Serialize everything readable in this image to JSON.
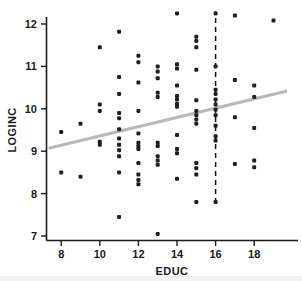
{
  "chart_data": {
    "type": "scatter",
    "title": "",
    "xlabel": "EDUC",
    "ylabel": "LOGINC",
    "xlim": [
      7.2,
      19.8
    ],
    "ylim": [
      6.75,
      12.45
    ],
    "xticks": [
      8,
      10,
      12,
      14,
      16,
      18
    ],
    "yticks": [
      7,
      8,
      9,
      10,
      11,
      12
    ],
    "xtick_labels": [
      "8",
      "10",
      "12",
      "14",
      "16",
      "18"
    ],
    "ytick_labels": [
      "7",
      "8",
      "9",
      "10",
      "11",
      "12"
    ],
    "grid": false,
    "legend": null,
    "point_color": "#1f1f1f",
    "point_size": 2.0,
    "series": [
      {
        "name": "observations",
        "points": [
          [
            8,
            9.45
          ],
          [
            8,
            8.5
          ],
          [
            9,
            9.65
          ],
          [
            9,
            8.4
          ],
          [
            10,
            11.45
          ],
          [
            10,
            10.1
          ],
          [
            10,
            9.95
          ],
          [
            10,
            9.22
          ],
          [
            10,
            9.15
          ],
          [
            11,
            11.82
          ],
          [
            11,
            10.75
          ],
          [
            11,
            10.35
          ],
          [
            11,
            9.9
          ],
          [
            11,
            9.78
          ],
          [
            11,
            9.52
          ],
          [
            11,
            9.3
          ],
          [
            11,
            9.15
          ],
          [
            11,
            9.02
          ],
          [
            11,
            8.88
          ],
          [
            11,
            8.5
          ],
          [
            11,
            7.45
          ],
          [
            12,
            11.25
          ],
          [
            12,
            11.1
          ],
          [
            12,
            10.62
          ],
          [
            12,
            9.95
          ],
          [
            12,
            9.42
          ],
          [
            12,
            9.2
          ],
          [
            12,
            9.12
          ],
          [
            12,
            9.05
          ],
          [
            12,
            8.72
          ],
          [
            12,
            8.45
          ],
          [
            12,
            8.32
          ],
          [
            12,
            8.22
          ],
          [
            13,
            11.0
          ],
          [
            13,
            10.88
          ],
          [
            13,
            10.72
          ],
          [
            13,
            10.38
          ],
          [
            13,
            10.28
          ],
          [
            13,
            9.2
          ],
          [
            13,
            9.12
          ],
          [
            13,
            8.88
          ],
          [
            13,
            8.78
          ],
          [
            13,
            8.68
          ],
          [
            13,
            7.05
          ],
          [
            14,
            12.25
          ],
          [
            14,
            11.05
          ],
          [
            14,
            10.95
          ],
          [
            14,
            10.55
          ],
          [
            14,
            10.3
          ],
          [
            14,
            10.22
          ],
          [
            14,
            10.12
          ],
          [
            14,
            10.05
          ],
          [
            14,
            9.38
          ],
          [
            14,
            9.05
          ],
          [
            14,
            8.95
          ],
          [
            14,
            8.35
          ],
          [
            15,
            11.7
          ],
          [
            15,
            11.6
          ],
          [
            15,
            11.45
          ],
          [
            15,
            10.92
          ],
          [
            15,
            10.2
          ],
          [
            15,
            9.95
          ],
          [
            15,
            9.85
          ],
          [
            15,
            9.75
          ],
          [
            15,
            9.65
          ],
          [
            15,
            8.72
          ],
          [
            15,
            8.6
          ],
          [
            15,
            8.45
          ],
          [
            15,
            7.8
          ],
          [
            16,
            12.25
          ],
          [
            16,
            11.0
          ],
          [
            16,
            10.45
          ],
          [
            16,
            10.35
          ],
          [
            16,
            10.22
          ],
          [
            16,
            10.1
          ],
          [
            16,
            9.98
          ],
          [
            16,
            9.85
          ],
          [
            16,
            9.6
          ],
          [
            16,
            9.35
          ],
          [
            16,
            9.25
          ],
          [
            16,
            7.8
          ],
          [
            17,
            12.2
          ],
          [
            17,
            10.68
          ],
          [
            17,
            9.8
          ],
          [
            17,
            8.7
          ],
          [
            18,
            10.55
          ],
          [
            18,
            10.28
          ],
          [
            18,
            9.55
          ],
          [
            18,
            8.78
          ],
          [
            18,
            8.62
          ],
          [
            19,
            12.08
          ]
        ]
      }
    ],
    "regression_line": {
      "name": "fit-line",
      "color": "#b8b8b8",
      "x_start": 7.35,
      "y_start": 9.07,
      "x_end": 19.7,
      "y_end": 10.42
    },
    "reference_line": {
      "name": "vertical-reference",
      "x": 16,
      "y_start": 7.78,
      "y_end": 12.3,
      "style": "dashed",
      "color": "#111111"
    }
  }
}
